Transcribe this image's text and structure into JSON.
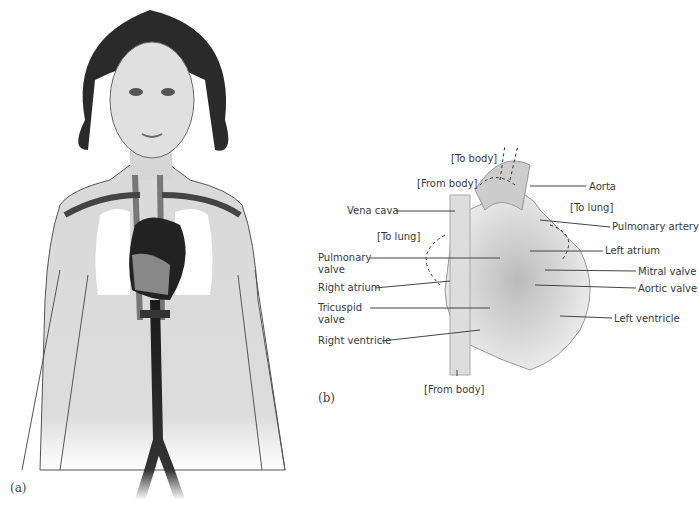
{
  "figure": {
    "panel_a": {
      "caption": "(a)",
      "subject": "human torso with circulatory system, heart and lungs"
    },
    "panel_b": {
      "caption": "(b)",
      "subject": "cross-section of the human heart",
      "labels": {
        "to_body": "[To body]",
        "from_body_top": "[From body]",
        "aorta": "Aorta",
        "vena_cava": "Vena cava",
        "to_lung_left": "[To lung]",
        "to_lung_right": "[To lung]",
        "pulmonary_artery": "Pulmonary artery",
        "pulmonary_valve": "Pulmonary valve",
        "left_atrium": "Left atrium",
        "right_atrium": "Right atrium",
        "mitral_valve": "Mitral valve",
        "aortic_valve": "Aortic valve",
        "tricuspid_valve": "Tricuspid valve",
        "right_ventricle": "Right ventricle",
        "left_ventricle": "Left ventricle",
        "from_body_bottom": "[From body]"
      }
    }
  }
}
